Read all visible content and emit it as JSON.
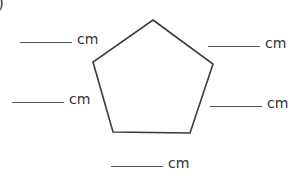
{
  "item_label": ")",
  "shape": {
    "type": "pentagon",
    "stroke": "#3a3a3a",
    "points": "153,20 213,64 190,133 113,132 93,62"
  },
  "answers": [
    {
      "position": "top-left",
      "value": "",
      "unit": "cm"
    },
    {
      "position": "top-right",
      "value": "",
      "unit": "cm"
    },
    {
      "position": "middle-left",
      "value": "",
      "unit": "cm"
    },
    {
      "position": "middle-right",
      "value": "",
      "unit": "cm"
    },
    {
      "position": "bottom",
      "value": "",
      "unit": "cm"
    }
  ]
}
